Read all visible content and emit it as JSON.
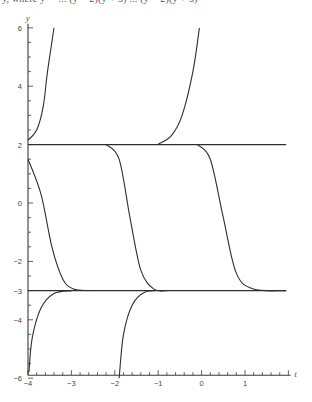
{
  "caption": "y, where y' = ... (y − 2)(y + 3) ... (y − 2)(y + 3)",
  "chart_data": {
    "type": "line",
    "title": "",
    "xlabel": "t",
    "ylabel": "y",
    "xlim": [
      -4,
      2
    ],
    "ylim": [
      -6,
      6
    ],
    "x_ticks": [
      -4,
      -3,
      -2,
      -1,
      0,
      1
    ],
    "y_ticks": [
      6,
      4,
      2,
      0,
      -2,
      -3,
      -4,
      -6
    ],
    "grid": false,
    "legend": null,
    "equilibria": [
      2,
      -3
    ],
    "series": [
      {
        "name": "equilibrium y=2",
        "points": [
          [
            -4,
            2
          ],
          [
            1.95,
            2
          ]
        ]
      },
      {
        "name": "equilibrium y=-3",
        "points": [
          [
            -4,
            -3
          ],
          [
            1.95,
            -3
          ]
        ]
      },
      {
        "name": "solution above 2 (left)",
        "points": [
          [
            -4,
            2.15
          ],
          [
            -3.8,
            2.5
          ],
          [
            -3.65,
            3.3
          ],
          [
            -3.55,
            4.5
          ],
          [
            -3.4,
            6
          ]
        ]
      },
      {
        "name": "solution above 2 (right)",
        "points": [
          [
            -1.0,
            2.02
          ],
          [
            -0.7,
            2.3
          ],
          [
            -0.45,
            3.0
          ],
          [
            -0.2,
            4.5
          ],
          [
            -0.05,
            6
          ]
        ]
      },
      {
        "name": "solution between (A)",
        "points": [
          [
            -4,
            1.5
          ],
          [
            -3.7,
            0.3
          ],
          [
            -3.45,
            -1.5
          ],
          [
            -3.2,
            -2.6
          ],
          [
            -2.95,
            -2.95
          ],
          [
            -2.6,
            -3
          ]
        ]
      },
      {
        "name": "solution between (B)",
        "points": [
          [
            -2.2,
            2
          ],
          [
            -1.9,
            1.5
          ],
          [
            -1.65,
            -0.5
          ],
          [
            -1.4,
            -2.3
          ],
          [
            -1.1,
            -2.95
          ],
          [
            -0.8,
            -3
          ]
        ]
      },
      {
        "name": "solution between (C)",
        "points": [
          [
            -0.1,
            2
          ],
          [
            0.2,
            1.5
          ],
          [
            0.5,
            -0.5
          ],
          [
            0.8,
            -2.4
          ],
          [
            1.2,
            -2.95
          ],
          [
            1.95,
            -3
          ]
        ]
      },
      {
        "name": "solution below -3 (left)",
        "points": [
          [
            -3.98,
            -5.8
          ],
          [
            -3.9,
            -4.6
          ],
          [
            -3.7,
            -3.6
          ],
          [
            -3.4,
            -3.1
          ],
          [
            -3.0,
            -3.0
          ]
        ]
      },
      {
        "name": "solution below -3 (right)",
        "points": [
          [
            -1.9,
            -6
          ],
          [
            -1.8,
            -4.5
          ],
          [
            -1.6,
            -3.5
          ],
          [
            -1.3,
            -3.05
          ],
          [
            -0.9,
            -3.0
          ]
        ]
      }
    ]
  }
}
